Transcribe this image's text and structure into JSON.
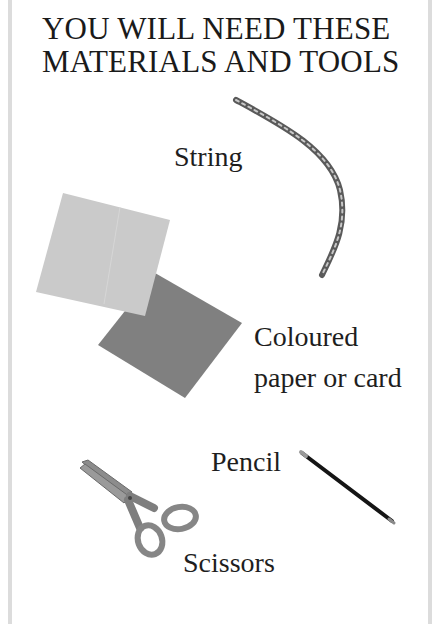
{
  "title": {
    "line1": "YOU WILL NEED THESE",
    "line2": "MATERIALS AND TOOLS"
  },
  "items": [
    {
      "id": "string",
      "label": "String",
      "icon": "string-icon"
    },
    {
      "id": "paper",
      "label_line1": "Coloured",
      "label_line2": "paper or card",
      "icon": "coloured-paper-icon"
    },
    {
      "id": "pencil",
      "label": "Pencil",
      "icon": "pencil-icon"
    },
    {
      "id": "scissors",
      "label": "Scissors",
      "icon": "scissors-icon"
    }
  ],
  "colors": {
    "frame": "#dcdcdc",
    "paper_light": "#c9c9c9",
    "paper_dark": "#7f7f7f",
    "string": "#5a5a5a",
    "pencil": "#151515",
    "scissors": "#8a8a8a"
  }
}
